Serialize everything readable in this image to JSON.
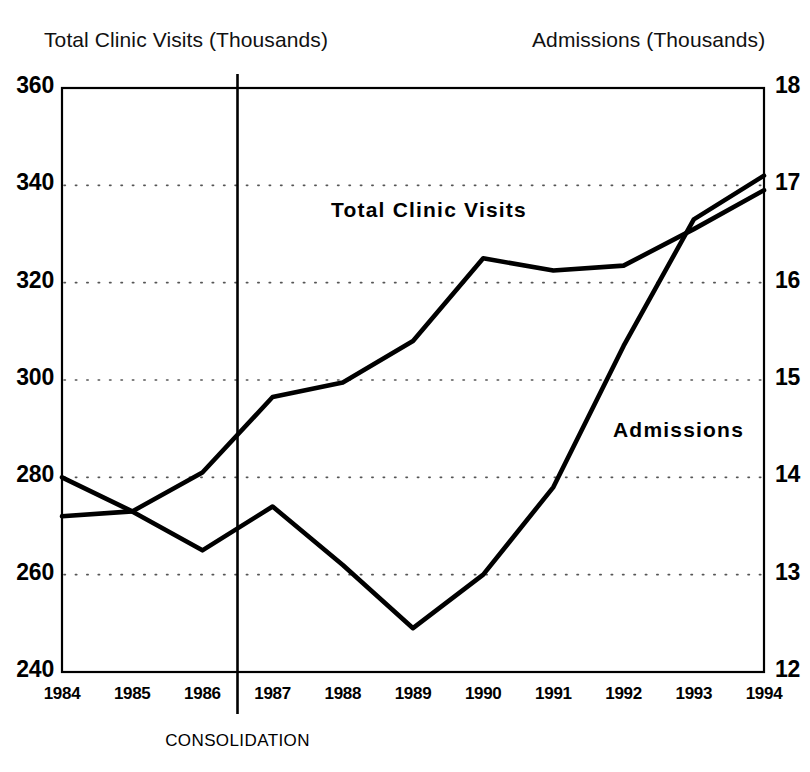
{
  "chart_data": {
    "type": "line",
    "title": "",
    "x": [
      1984,
      1985,
      1986,
      1987,
      1988,
      1989,
      1990,
      1991,
      1992,
      1993,
      1994
    ],
    "categories": [
      "1984",
      "1985",
      "1986",
      "1987",
      "1988",
      "1989",
      "1990",
      "1991",
      "1992",
      "1993",
      "1994"
    ],
    "xlabel": "",
    "grid": "horizontal-dotted",
    "legend": "inline-labels",
    "series": [
      {
        "name": "Total Clinic Visits",
        "axis": "left",
        "unit": "Thousands",
        "values": [
          272,
          273,
          281,
          296.5,
          299.5,
          308,
          325,
          322.5,
          323.5,
          331,
          339
        ]
      },
      {
        "name": "Admissions",
        "axis": "right",
        "unit": "Thousands",
        "values": [
          14.0,
          13.65,
          13.25,
          13.7,
          13.1,
          12.45,
          13.0,
          13.9,
          15.35,
          16.65,
          17.1
        ]
      }
    ],
    "axes": {
      "left": {
        "title": "Total Clinic Visits (Thousands)",
        "ticks": [
          "360",
          "340",
          "320",
          "300",
          "280",
          "260",
          "240"
        ],
        "tick_values": [
          360,
          340,
          320,
          300,
          280,
          260,
          240
        ],
        "ylim": [
          240,
          360
        ]
      },
      "right": {
        "title": "Admissions (Thousands)",
        "ticks": [
          "18",
          "17",
          "16",
          "15",
          "14",
          "13",
          "12"
        ],
        "tick_values": [
          18,
          17,
          16,
          15,
          14,
          13,
          12
        ],
        "ylim": [
          12,
          18
        ]
      }
    },
    "annotations": [
      {
        "name": "consolidation-marker",
        "label": "CONSOLIDATION",
        "type": "vertical-line",
        "x_position": 1986.5
      }
    ],
    "series_labels": [
      {
        "name": "Total Clinic Visits"
      },
      {
        "name": "Admissions"
      }
    ],
    "colors": {
      "line": "#000000",
      "grid": "#555555",
      "axis": "#000000",
      "background": "#ffffff"
    }
  }
}
